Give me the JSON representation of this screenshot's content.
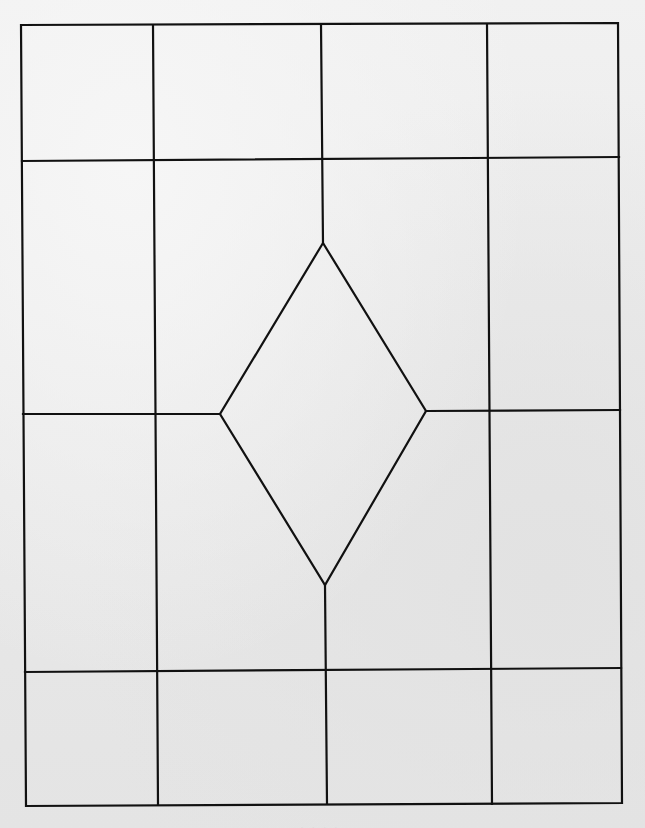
{
  "diagram": {
    "type": "grid-with-diamond-template",
    "stroke_color": "#111111",
    "background_color": "#ececec",
    "grid": {
      "columns": 4,
      "rows": 4,
      "outer_frame": {
        "top_left": [
          21,
          25
        ],
        "top_right": [
          618,
          23
        ],
        "bottom_right": [
          622,
          803
        ],
        "bottom_left": [
          26,
          806
        ]
      }
    },
    "diamond": {
      "top": [
        323,
        243
      ],
      "right": [
        426,
        411
      ],
      "bottom": [
        325,
        585
      ],
      "left": [
        220,
        414
      ]
    }
  },
  "footer": {
    "cutoff_text": "· · · ·"
  }
}
